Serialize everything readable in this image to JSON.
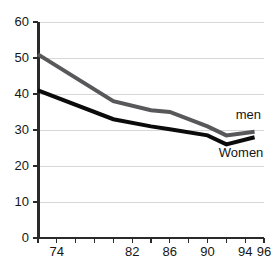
{
  "chart_data": {
    "type": "line",
    "title": "",
    "xlabel": "",
    "ylabel": "",
    "xlim": [
      72,
      96
    ],
    "ylim": [
      0,
      60
    ],
    "grid": "horizontal",
    "legend_position": "inline-right",
    "y_ticks": [
      0,
      10,
      20,
      30,
      40,
      50,
      60
    ],
    "y_tick_labels": [
      "0",
      "10",
      "20",
      "30",
      "40",
      "50",
      "60"
    ],
    "x_ticks": [
      72,
      74,
      76,
      78,
      80,
      82,
      84,
      86,
      88,
      90,
      92,
      94,
      96
    ],
    "x_tick_labels": [
      "",
      "74",
      "",
      "",
      "",
      "82",
      "",
      "86",
      "",
      "90",
      "",
      "94",
      "96"
    ],
    "x": [
      72,
      80,
      84,
      86,
      90,
      92,
      95
    ],
    "series": [
      {
        "name": "men",
        "color": "#58585a",
        "values": [
          51,
          38,
          35.5,
          35,
          31,
          28.5,
          29.5
        ]
      },
      {
        "name": "Women",
        "color": "#0b0b0b",
        "values": [
          41,
          33,
          31,
          30.2,
          28.5,
          26,
          28
        ]
      }
    ],
    "annotations": [
      {
        "text": "men",
        "series": "men",
        "x": 93,
        "y": 33
      },
      {
        "text": "Women",
        "series": "Women",
        "x": 91.2,
        "y": 22.5
      }
    ]
  }
}
